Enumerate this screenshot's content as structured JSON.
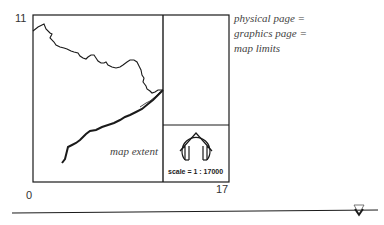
{
  "diagram": {
    "axis": {
      "y_max_label": "11",
      "origin_label": "0",
      "x_max_label": "17"
    },
    "annotations": {
      "page_note_lines": [
        "physical page =",
        "graphics page =",
        "map limits"
      ],
      "map_extent_label": "map extent",
      "scale_label": "scale = 1 : 17000"
    },
    "icons": {
      "north_arrow": "north-arrow-icon",
      "baseline_marker": "triangle-marker-icon"
    },
    "colors": {
      "line": "#1a1a1a",
      "text": "#444444",
      "background": "#ffffff"
    }
  }
}
